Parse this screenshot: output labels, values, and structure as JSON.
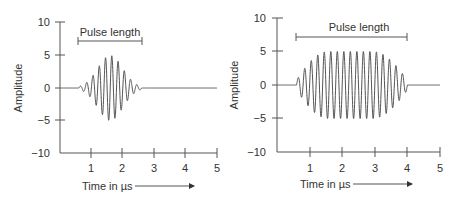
{
  "chart_data": [
    {
      "type": "line",
      "title": "",
      "xlabel": "Time in µs",
      "ylabel": "Amplitude",
      "xlim": [
        0,
        5
      ],
      "ylim": [
        -10,
        10
      ],
      "xticks": [
        "1",
        "2",
        "3",
        "4",
        "5"
      ],
      "yticks": [
        "10",
        "5",
        "0",
        "−5",
        "−10"
      ],
      "grid": false,
      "annotation": {
        "text": "Pulse length",
        "x_start": 0.6,
        "x_end": 2.6
      },
      "series": [
        {
          "name": "short pulse",
          "description": "Gaussian-enveloped sinusoid, ~10 cycles, peak amplitude ≈5 at t≈1.6 µs, zero outside 0.6–2.6 µs",
          "pulse_start": 0.6,
          "pulse_end": 2.6,
          "peak_time": 1.6,
          "peak_amplitude": 5,
          "cycles_per_us": 5
        }
      ]
    },
    {
      "type": "line",
      "title": "",
      "xlabel": "Time in µs",
      "ylabel": "Amplitude",
      "xlim": [
        0,
        5
      ],
      "ylim": [
        -10,
        10
      ],
      "xticks": [
        "1",
        "2",
        "3",
        "4",
        "5"
      ],
      "yticks": [
        "10",
        "5",
        "0",
        "−5",
        "−10"
      ],
      "grid": false,
      "annotation": {
        "text": "Pulse length",
        "x_start": 0.6,
        "x_end": 4.0
      },
      "series": [
        {
          "name": "long pulse",
          "description": "Sinusoid with flat-top envelope, ~17 cycles, amplitude ≈5 plateau from ~1.5 to ~3.0 µs, tapering to 0 at 0.6 and 4.0 µs",
          "pulse_start": 0.6,
          "pulse_end": 4.0,
          "plateau": [
            1.5,
            3.0
          ],
          "peak_amplitude": 5,
          "cycles_per_us": 5
        }
      ]
    }
  ],
  "labels": {
    "left": {
      "ylabel": "Amplitude",
      "xlabel": "Time in µs",
      "annotation": "Pulse length",
      "yticks": [
        "10",
        "5",
        "0",
        "−5",
        "−10"
      ],
      "xticks": [
        "1",
        "2",
        "3",
        "4",
        "5"
      ]
    },
    "right": {
      "ylabel": "Amplitude",
      "xlabel": "Time in µs",
      "annotation": "Pulse length",
      "yticks": [
        "10",
        "5",
        "0",
        "−5",
        "−10"
      ],
      "xticks": [
        "1",
        "2",
        "3",
        "4",
        "5"
      ]
    }
  }
}
